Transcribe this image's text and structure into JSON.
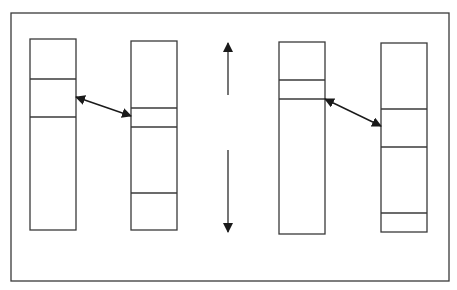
{
  "diagram": {
    "type": "block-mapping-diagram",
    "stroke_color": "#3a3a3a",
    "background_color": "#ffffff",
    "frame": {
      "x": 11,
      "y": 13,
      "width": 438,
      "height": 268
    },
    "columns": [
      {
        "id": "column-1",
        "x": 30,
        "y": 39,
        "width": 46,
        "height": 191,
        "dividers_y": [
          79,
          117
        ]
      },
      {
        "id": "column-2",
        "x": 131,
        "y": 41,
        "width": 46,
        "height": 189,
        "dividers_y": [
          108,
          127,
          193
        ]
      },
      {
        "id": "column-3",
        "x": 279,
        "y": 42,
        "width": 46,
        "height": 192,
        "dividers_y": [
          80,
          99
        ]
      },
      {
        "id": "column-4",
        "x": 381,
        "y": 43,
        "width": 46,
        "height": 189,
        "dividers_y": [
          109,
          147,
          213
        ]
      }
    ],
    "mapping_arrows": [
      {
        "id": "mapping-arrow-1",
        "from": [
          76,
          97
        ],
        "to": [
          131,
          116
        ],
        "bidirectional": true
      },
      {
        "id": "mapping-arrow-2",
        "from": [
          325,
          99
        ],
        "to": [
          381,
          126
        ],
        "bidirectional": true
      }
    ],
    "vertical_arrows": [
      {
        "id": "up-arrow",
        "x": 228,
        "y_start": 95,
        "y_end": 43
      },
      {
        "id": "down-arrow",
        "x": 228,
        "y_start": 150,
        "y_end": 232
      }
    ]
  }
}
